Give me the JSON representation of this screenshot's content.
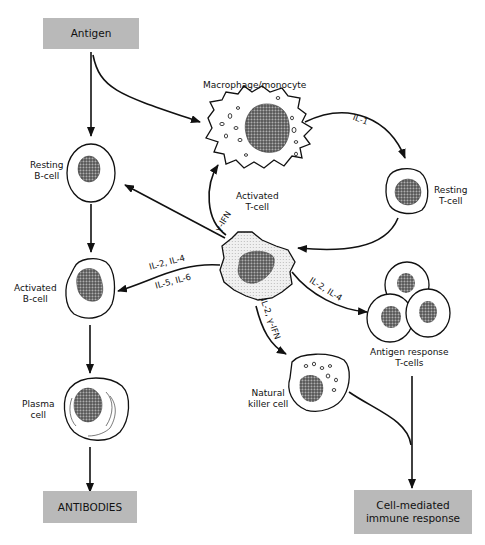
{
  "diagram": {
    "boxes": {
      "antigen": "Antigen",
      "antibodies": "ANTIBODIES",
      "cell_mediated_line1": "Cell-mediated",
      "cell_mediated_line2": "immune response"
    },
    "cells": {
      "macrophage": "Macrophage/monocyte",
      "resting_b_line1": "Resting",
      "resting_b_line2": "B-cell",
      "activated_t_line1": "Activated",
      "activated_t_line2": "T-cell",
      "resting_t_line1": "Resting",
      "resting_t_line2": "T-cell",
      "activated_b_line1": "Activated",
      "activated_b_line2": "B-cell",
      "antigen_response_line1": "Antigen response",
      "antigen_response_line2": "T-cells",
      "plasma_line1": "Plasma",
      "plasma_line2": "cell",
      "nk_line1": "Natural",
      "nk_line2": "killer cell"
    },
    "cytokines": {
      "il1": "IL-1",
      "gamma_ifn": "γ-IFN",
      "il2_il4_to_b": "IL-2, IL-4",
      "il5_il6_to_b": "IL-5, IL-6",
      "il2_il4_to_t": "IL-2, IL-4",
      "il2_gamma_ifn": "IL-2, γ-IFN"
    },
    "colors": {
      "box_fill": "#b9b9b9",
      "line": "#111111",
      "nucleus": "#555555",
      "activated_t_fill": "#e4e4e4"
    }
  }
}
